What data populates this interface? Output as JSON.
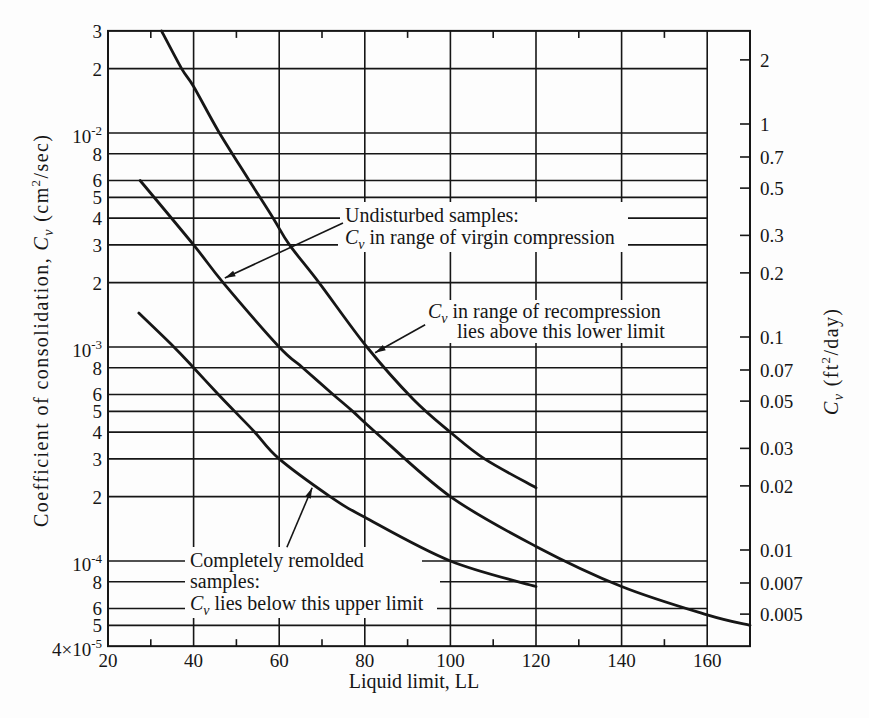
{
  "chart_data": {
    "type": "line",
    "title": "",
    "xlabel": "Liquid limit, LL",
    "ylabel": "Coefficient of consolidation, Cv (cm²/sec)",
    "ylabel_right": "Cv (ft²/day)",
    "ylabel_parts": [
      {
        "t": "Coefficient of consolidation, "
      },
      {
        "t": "C",
        "style": "italic"
      },
      {
        "t": "v",
        "style": "sub"
      },
      {
        "t": " (cm"
      },
      {
        "t": "2",
        "style": "sup"
      },
      {
        "t": "/sec)"
      }
    ],
    "ylabel_right_parts": [
      {
        "t": "C",
        "style": "italic"
      },
      {
        "t": "v",
        "style": "sub"
      },
      {
        "t": " (ft"
      },
      {
        "t": "2",
        "style": "sup"
      },
      {
        "t": "/day)"
      }
    ],
    "xlim": [
      20,
      170
    ],
    "ylim": [
      4e-05,
      0.03
    ],
    "yscale": "log",
    "grid": true,
    "legend": null,
    "x_ticks": [
      {
        "value": 20,
        "label": "20"
      },
      {
        "value": 40,
        "label": "40"
      },
      {
        "value": 60,
        "label": "60"
      },
      {
        "value": 80,
        "label": "80"
      },
      {
        "value": 100,
        "label": "100"
      },
      {
        "value": 120,
        "label": "120"
      },
      {
        "value": 140,
        "label": "140"
      },
      {
        "value": 160,
        "label": "160"
      }
    ],
    "x_minor_ticks": [
      30,
      50,
      70,
      90,
      110,
      130,
      150
    ],
    "y_ticks": [
      {
        "value": 0.03,
        "base": "3"
      },
      {
        "value": 0.02,
        "base": "2"
      },
      {
        "value": 0.01,
        "base": "10",
        "exp": "-2"
      },
      {
        "value": 0.008,
        "base": "8"
      },
      {
        "value": 0.006,
        "base": "6"
      },
      {
        "value": 0.005,
        "base": "5"
      },
      {
        "value": 0.004,
        "base": "4"
      },
      {
        "value": 0.003,
        "base": "3"
      },
      {
        "value": 0.002,
        "base": "2"
      },
      {
        "value": 0.001,
        "base": "10",
        "exp": "-3"
      },
      {
        "value": 0.0008,
        "base": "8"
      },
      {
        "value": 0.0006,
        "base": "6"
      },
      {
        "value": 0.0005,
        "base": "5"
      },
      {
        "value": 0.0004,
        "base": "4"
      },
      {
        "value": 0.0003,
        "base": "3"
      },
      {
        "value": 0.0002,
        "base": "2"
      },
      {
        "value": 0.0001,
        "base": "10",
        "exp": "-4"
      },
      {
        "value": 8e-05,
        "base": "8"
      },
      {
        "value": 6e-05,
        "base": "6"
      },
      {
        "value": 5e-05,
        "base": "5"
      },
      {
        "value": 4e-05,
        "base": "4×10",
        "exp": "-5"
      }
    ],
    "y_right_ticks": [
      {
        "value": 2,
        "label": "2"
      },
      {
        "value": 1,
        "label": "1"
      },
      {
        "value": 0.7,
        "label": "0.7"
      },
      {
        "value": 0.5,
        "label": "0.5"
      },
      {
        "value": 0.3,
        "label": "0.3"
      },
      {
        "value": 0.2,
        "label": "0.2"
      },
      {
        "value": 0.1,
        "label": "0.1"
      },
      {
        "value": 0.07,
        "label": "0.07"
      },
      {
        "value": 0.05,
        "label": "0.05"
      },
      {
        "value": 0.03,
        "label": "0.03"
      },
      {
        "value": 0.02,
        "label": "0.02"
      },
      {
        "value": 0.01,
        "label": "0.01"
      },
      {
        "value": 0.007,
        "label": "0.007"
      },
      {
        "value": 0.005,
        "label": "0.005"
      }
    ],
    "series": [
      {
        "name": "Cv in range of recompression (lower limit)",
        "x": [
          32.5,
          37.2,
          40,
          45.8,
          53,
          58.6,
          62.4,
          69.3,
          80.5,
          91.3,
          100,
          108,
          120
        ],
        "y": [
          0.03,
          0.02,
          0.0165,
          0.0102,
          0.006,
          0.004,
          0.003,
          0.002,
          0.001,
          0.00057,
          0.0004,
          0.0003,
          0.00022
        ]
      },
      {
        "name": "Undisturbed samples: Cv in range of virgin compression",
        "x": [
          27.5,
          40,
          46.9,
          60,
          65.5,
          72.6,
          77.2,
          82.5,
          100,
          120,
          140,
          160,
          170
        ],
        "y": [
          0.006,
          0.003,
          0.002,
          0.001,
          0.0008,
          0.0006,
          0.0005,
          0.0004,
          0.0002,
          0.000117,
          7.6e-05,
          5.6e-05,
          5e-05
        ]
      },
      {
        "name": "Completely remolded samples: Cv upper limit",
        "x": [
          27.2,
          35.4,
          40,
          45.8,
          49.6,
          54.3,
          60,
          71.9,
          80,
          100,
          120
        ],
        "y": [
          0.00144,
          0.001,
          0.0008,
          0.0006,
          0.0005,
          0.0004,
          0.0003,
          0.0002,
          0.00016,
          0.0001,
          7.6e-05
        ]
      }
    ],
    "annotations": [
      {
        "lines": [
          [
            {
              "t": "Undisturbed samples:"
            }
          ],
          [
            {
              "t": "C",
              "style": "italic"
            },
            {
              "t": "v",
              "style": "sub"
            },
            {
              "t": " in range of virgin compression"
            }
          ]
        ],
        "arrow_from": [
          74.9,
          0.0038
        ],
        "arrow_to": [
          47.3,
          0.0021
        ]
      },
      {
        "lines": [
          [
            {
              "t": "C",
              "style": "italic"
            },
            {
              "t": "v",
              "style": "sub"
            },
            {
              "t": " in range of recompression"
            }
          ],
          [
            {
              "t": "lies above this lower limit"
            }
          ]
        ],
        "arrow_from": [
          94.1,
          0.00127
        ],
        "arrow_to": [
          82.4,
          0.00094
        ]
      },
      {
        "lines": [
          [
            {
              "t": "Completely remolded"
            }
          ],
          [
            {
              "t": "samples:"
            }
          ],
          [
            {
              "t": "C",
              "style": "italic"
            },
            {
              "t": "v",
              "style": "sub"
            },
            {
              "t": " lies below this upper limit"
            }
          ]
        ],
        "arrow_from": [
          61.8,
          0.000116
        ],
        "arrow_to": [
          67.7,
          0.00022
        ]
      }
    ]
  }
}
